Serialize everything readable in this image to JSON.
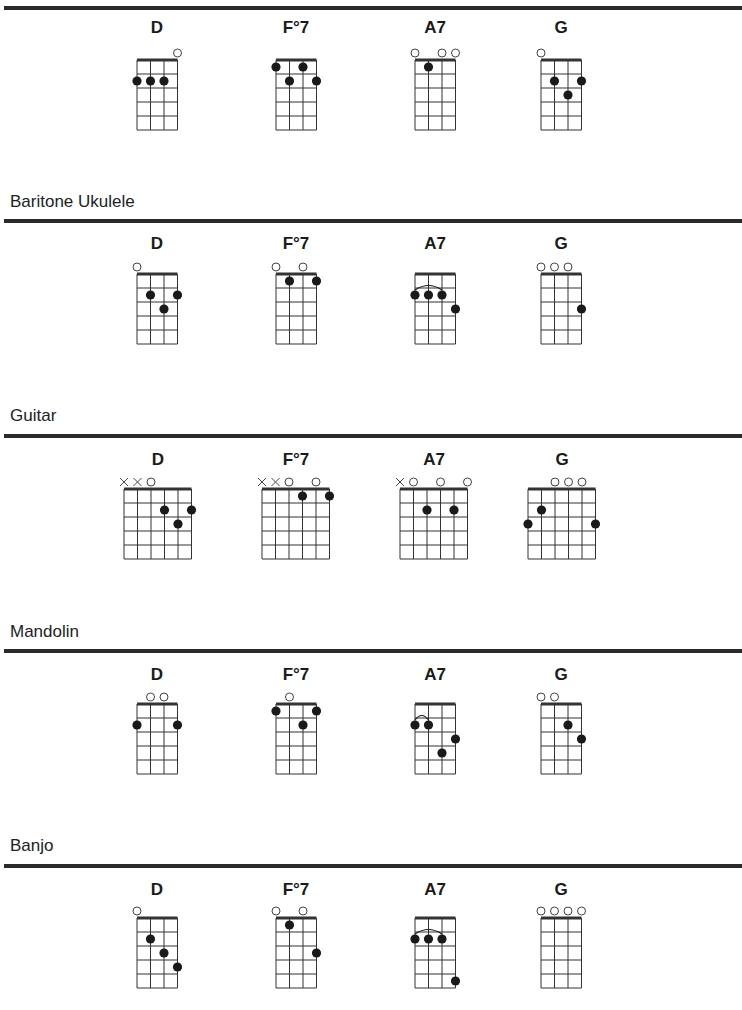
{
  "sections": [
    {
      "title": "",
      "instrument": "ukulele",
      "strings": 4,
      "chords": [
        {
          "name": "D",
          "open": [
            3
          ],
          "muted": [],
          "dots": [
            [
              0,
              2
            ],
            [
              1,
              2
            ],
            [
              2,
              2
            ]
          ],
          "barre": null
        },
        {
          "name": "F°7",
          "open": [],
          "muted": [],
          "dots": [
            [
              0,
              1
            ],
            [
              2,
              1
            ],
            [
              1,
              2
            ],
            [
              3,
              2
            ]
          ],
          "barre": null
        },
        {
          "name": "A7",
          "open": [
            0,
            2,
            3
          ],
          "muted": [],
          "dots": [
            [
              1,
              1
            ]
          ],
          "barre": null
        },
        {
          "name": "G",
          "open": [
            0
          ],
          "muted": [],
          "dots": [
            [
              1,
              2
            ],
            [
              3,
              2
            ],
            [
              2,
              3
            ]
          ],
          "barre": null
        }
      ]
    },
    {
      "title": "Baritone Ukulele",
      "instrument": "baritone-ukulele",
      "strings": 4,
      "chords": [
        {
          "name": "D",
          "open": [
            0
          ],
          "muted": [],
          "dots": [
            [
              1,
              2
            ],
            [
              3,
              2
            ],
            [
              2,
              3
            ]
          ],
          "barre": null
        },
        {
          "name": "F°7",
          "open": [
            0,
            2
          ],
          "muted": [],
          "dots": [
            [
              1,
              1
            ],
            [
              3,
              1
            ]
          ],
          "barre": null
        },
        {
          "name": "A7",
          "open": [],
          "muted": [],
          "dots": [
            [
              0,
              2
            ],
            [
              1,
              2
            ],
            [
              2,
              2
            ],
            [
              3,
              3
            ]
          ],
          "barre": [
            0,
            2,
            2
          ]
        },
        {
          "name": "G",
          "open": [
            0,
            1,
            2
          ],
          "muted": [],
          "dots": [
            [
              3,
              3
            ]
          ],
          "barre": null
        }
      ]
    },
    {
      "title": "Guitar",
      "instrument": "guitar",
      "strings": 6,
      "chords": [
        {
          "name": "D",
          "open": [
            2
          ],
          "muted": [
            0,
            1
          ],
          "dots": [
            [
              3,
              2
            ],
            [
              5,
              2
            ],
            [
              4,
              3
            ]
          ],
          "barre": null
        },
        {
          "name": "F°7",
          "open": [
            2,
            4
          ],
          "muted": [
            0,
            1
          ],
          "dots": [
            [
              3,
              1
            ],
            [
              5,
              1
            ]
          ],
          "barre": null
        },
        {
          "name": "A7",
          "open": [
            1,
            3,
            5
          ],
          "muted": [
            0
          ],
          "dots": [
            [
              2,
              2
            ],
            [
              4,
              2
            ]
          ],
          "barre": null
        },
        {
          "name": "G",
          "open": [
            2,
            3,
            4
          ],
          "muted": [],
          "dots": [
            [
              1,
              2
            ],
            [
              0,
              3
            ],
            [
              5,
              3
            ]
          ],
          "barre": null
        }
      ]
    },
    {
      "title": "Mandolin",
      "instrument": "mandolin",
      "strings": 4,
      "chords": [
        {
          "name": "D",
          "open": [
            1,
            2
          ],
          "muted": [],
          "dots": [
            [
              0,
              2
            ],
            [
              3,
              2
            ]
          ],
          "barre": null
        },
        {
          "name": "F°7",
          "open": [
            1
          ],
          "muted": [],
          "dots": [
            [
              0,
              1
            ],
            [
              3,
              1
            ],
            [
              2,
              2
            ]
          ],
          "barre": null
        },
        {
          "name": "A7",
          "open": [],
          "muted": [],
          "dots": [
            [
              0,
              2
            ],
            [
              1,
              2
            ],
            [
              3,
              3
            ],
            [
              2,
              4
            ]
          ],
          "barre": [
            0,
            1,
            2
          ]
        },
        {
          "name": "G",
          "open": [
            0,
            1
          ],
          "muted": [],
          "dots": [
            [
              2,
              2
            ],
            [
              3,
              3
            ]
          ],
          "barre": null
        }
      ]
    },
    {
      "title": "Banjo",
      "instrument": "banjo",
      "strings": 4,
      "chords": [
        {
          "name": "D",
          "open": [
            0
          ],
          "muted": [],
          "dots": [
            [
              1,
              2
            ],
            [
              2,
              3
            ],
            [
              3,
              4
            ]
          ],
          "barre": null
        },
        {
          "name": "F°7",
          "open": [
            0,
            2
          ],
          "muted": [],
          "dots": [
            [
              1,
              1
            ],
            [
              3,
              3
            ]
          ],
          "barre": null
        },
        {
          "name": "A7",
          "open": [],
          "muted": [],
          "dots": [
            [
              0,
              2
            ],
            [
              1,
              2
            ],
            [
              2,
              2
            ],
            [
              3,
              5
            ]
          ],
          "barre": [
            0,
            2,
            2
          ]
        },
        {
          "name": "G",
          "open": [
            0,
            1,
            2,
            3
          ],
          "muted": [],
          "dots": [],
          "barre": null
        }
      ]
    }
  ],
  "colors": {
    "ink": "#1a1a1a",
    "rule": "#2a2a2a",
    "grid": "#333333",
    "background": "#ffffff"
  }
}
